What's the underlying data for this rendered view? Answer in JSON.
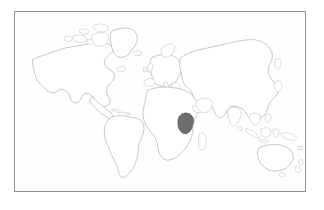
{
  "figure": {
    "kind": "world-locator-map",
    "title": "",
    "caption": "",
    "background_color": "#ffffff",
    "frame": {
      "border_color": "#8e8e8e",
      "fill_color": "#fefefe",
      "x": 14,
      "y": 11,
      "width": 292,
      "height": 181
    }
  },
  "map": {
    "projection": "equirectangular",
    "land_outline_color": "#9a9a9a",
    "land_fill_color": "#ffffff",
    "ocean_color": "#fefefe",
    "highlight_fill_color": "#6e6e6e",
    "highlight_outline_color": "#4a4a4a",
    "highlighted_country": "Tanzania",
    "highlighted_region": "East Africa",
    "continents": [
      "North America",
      "South America",
      "Europe",
      "Africa",
      "Asia",
      "Australia",
      "Greenland",
      "Arctic Islands"
    ],
    "notable_islands": [
      "Greenland",
      "Madagascar",
      "Iceland",
      "Great Britain",
      "Japan",
      "Philippines",
      "Indonesia",
      "New Zealand",
      "Sri Lanka",
      "Cuba",
      "Tasmania",
      "New Guinea"
    ],
    "legend": {
      "visible": false,
      "highlight_label": "Tanzania"
    },
    "labels": {
      "visible": false,
      "items": []
    }
  }
}
